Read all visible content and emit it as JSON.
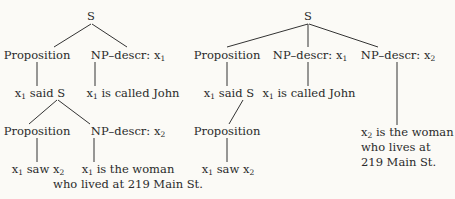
{
  "left_tree": {
    "root": "S",
    "proposition_1": "Proposition",
    "np_descr_1": {
      "label": "NP–descr:",
      "var": "x",
      "sub": "1"
    },
    "said": {
      "var": "x",
      "sub": "1",
      "text": "said S"
    },
    "called": {
      "var": "x",
      "sub": "1",
      "text": "is called John"
    },
    "proposition_2": "Proposition",
    "np_descr_2": {
      "label": "NP–descr:",
      "var": "x",
      "sub": "2"
    },
    "saw": {
      "var": "x",
      "sub": "1",
      "text": "saw",
      "obj": "x",
      "obj_sub": "2"
    },
    "woman": {
      "var": "x",
      "sub": "1",
      "text": "is the woman"
    },
    "woman_line2": "who lived at 219 Main St."
  },
  "right_tree": {
    "root": "S",
    "proposition_1": "Proposition",
    "np_descr_1": {
      "label": "NP–descr:",
      "var": "x",
      "sub": "1"
    },
    "np_descr_2": {
      "label": "NP–descr:",
      "var": "x",
      "sub": "2"
    },
    "said": {
      "var": "x",
      "sub": "1",
      "text": "said S"
    },
    "called": {
      "var": "x",
      "sub": "1",
      "text": "is called John"
    },
    "proposition_2": "Proposition",
    "saw": {
      "var": "x",
      "sub": "1",
      "text": "saw",
      "obj": "x",
      "obj_sub": "2"
    },
    "woman": {
      "var": "x",
      "sub": "2",
      "text": "is the woman"
    },
    "woman_line2": "who lives at",
    "woman_line3": "219 Main St."
  }
}
